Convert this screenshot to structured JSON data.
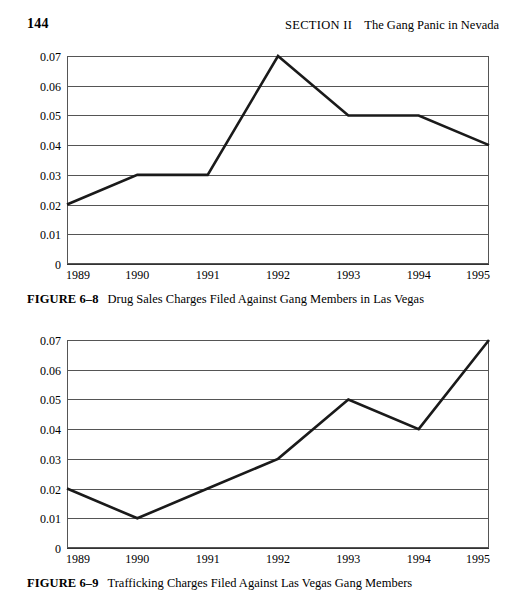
{
  "header": {
    "page_number": "144",
    "section": "SECTION II",
    "title": "The Gang Panic in Nevada"
  },
  "figures": [
    {
      "label": "FIGURE 6–8",
      "caption": "Drug Sales Charges Filed Against Gang Members in Las Vegas"
    },
    {
      "label": "FIGURE 6–9",
      "caption": "Trafficking Charges Filed Against Las Vegas Gang Members"
    }
  ],
  "chart_data": [
    {
      "type": "line",
      "title": "Drug Sales Charges Filed Against Gang Members in Las Vegas",
      "x": [
        "1989",
        "1990",
        "1991",
        "1992",
        "1993",
        "1994",
        "1995"
      ],
      "values": [
        0.02,
        0.03,
        0.03,
        0.07,
        0.05,
        0.05,
        0.04
      ],
      "xlabel": "",
      "ylabel": "",
      "ylim": [
        0,
        0.07
      ],
      "yticks": [
        "0",
        "0.01",
        "0.02",
        "0.03",
        "0.04",
        "0.05",
        "0.06",
        "0.07"
      ],
      "grid": true,
      "legend": false,
      "line_color": "#1a1a1a"
    },
    {
      "type": "line",
      "title": "Trafficking Charges Filed Against Las Vegas Gang Members",
      "x": [
        "1989",
        "1990",
        "1991",
        "1992",
        "1993",
        "1994",
        "1995"
      ],
      "values": [
        0.02,
        0.01,
        0.02,
        0.03,
        0.05,
        0.04,
        0.07
      ],
      "xlabel": "",
      "ylabel": "",
      "ylim": [
        0,
        0.07
      ],
      "yticks": [
        "0",
        "0.01",
        "0.02",
        "0.03",
        "0.04",
        "0.05",
        "0.06",
        "0.07"
      ],
      "grid": true,
      "legend": false,
      "line_color": "#1a1a1a"
    }
  ]
}
